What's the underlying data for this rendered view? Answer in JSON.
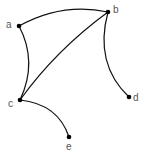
{
  "diagram": {
    "type": "graph",
    "directed": false,
    "nodes": [
      {
        "id": "a",
        "label": "a",
        "x": 19,
        "y": 26,
        "label_x": 6,
        "label_y": 28
      },
      {
        "id": "b",
        "label": "b",
        "x": 108,
        "y": 12,
        "label_x": 113,
        "label_y": 13
      },
      {
        "id": "c",
        "label": "c",
        "x": 20,
        "y": 100,
        "label_x": 8,
        "label_y": 107
      },
      {
        "id": "d",
        "label": "d",
        "x": 129,
        "y": 97,
        "label_x": 133,
        "label_y": 101
      },
      {
        "id": "e",
        "label": "e",
        "x": 69,
        "y": 137,
        "label_x": 66,
        "label_y": 150
      }
    ],
    "edges": [
      {
        "from": "a",
        "to": "b",
        "path": "M19,26 Q62,2 108,12"
      },
      {
        "from": "a",
        "to": "c",
        "path": "M19,26 Q38,62 20,100"
      },
      {
        "from": "b",
        "to": "c",
        "path": "M108,12 Q56,50 20,100"
      },
      {
        "from": "b",
        "to": "d",
        "path": "M108,12 Q94,64 129,97"
      },
      {
        "from": "c",
        "to": "e",
        "path": "M20,100 Q58,104 69,137"
      }
    ],
    "colors": {
      "edge": "#111111",
      "node": "#000000",
      "label": "#555555",
      "background": "#ffffff"
    }
  }
}
